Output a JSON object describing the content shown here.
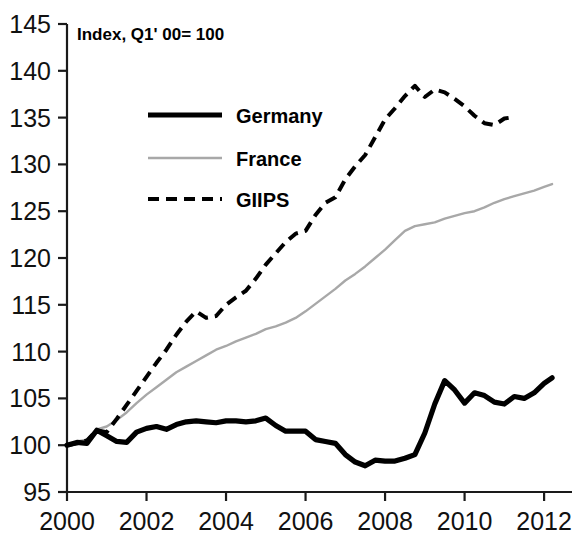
{
  "chart_data": {
    "type": "line",
    "title": "",
    "annotation": "Index, Q1' 00= 100",
    "xlabel": "",
    "ylabel": "",
    "xlim": [
      2000,
      2012.4
    ],
    "ylim": [
      95,
      145
    ],
    "grid": false,
    "legend_position": "upper-left-inside",
    "x_ticks": [
      "2000",
      "2002",
      "2004",
      "2006",
      "2008",
      "2010",
      "2012"
    ],
    "x_tick_values": [
      2000,
      2002,
      2004,
      2006,
      2008,
      2010,
      2012
    ],
    "y_ticks": [
      "95",
      "100",
      "105",
      "110",
      "115",
      "120",
      "125",
      "130",
      "135",
      "140",
      "145"
    ],
    "y_tick_values": [
      95,
      100,
      105,
      110,
      115,
      120,
      125,
      130,
      135,
      140,
      145
    ],
    "series": [
      {
        "name": "Germany",
        "color": "#000000",
        "style": "solid-thick",
        "x": [
          2000.0,
          2000.25,
          2000.5,
          2000.75,
          2001.0,
          2001.25,
          2001.5,
          2001.75,
          2002.0,
          2002.25,
          2002.5,
          2002.75,
          2003.0,
          2003.25,
          2003.5,
          2003.75,
          2004.0,
          2004.25,
          2004.5,
          2004.75,
          2005.0,
          2005.25,
          2005.5,
          2005.75,
          2006.0,
          2006.25,
          2006.5,
          2006.75,
          2007.0,
          2007.25,
          2007.5,
          2007.75,
          2008.0,
          2008.25,
          2008.5,
          2008.75,
          2009.0,
          2009.25,
          2009.5,
          2009.75,
          2010.0,
          2010.25,
          2010.5,
          2010.75,
          2011.0,
          2011.25,
          2011.5,
          2011.75,
          2012.0,
          2012.2
        ],
        "y": [
          100.0,
          100.3,
          100.2,
          101.6,
          101.0,
          100.4,
          100.3,
          101.4,
          101.8,
          102.0,
          101.7,
          102.2,
          102.5,
          102.6,
          102.5,
          102.4,
          102.6,
          102.6,
          102.5,
          102.6,
          102.9,
          102.1,
          101.5,
          101.5,
          101.5,
          100.6,
          100.4,
          100.2,
          99.0,
          98.2,
          97.8,
          98.4,
          98.3,
          98.3,
          98.6,
          99.0,
          101.3,
          104.4,
          106.9,
          105.9,
          104.5,
          105.6,
          105.3,
          104.6,
          104.4,
          105.2,
          105.0,
          105.6,
          106.6,
          107.2
        ]
      },
      {
        "name": "France",
        "color": "#a8a8a8",
        "style": "solid-thin",
        "x": [
          2000.0,
          2000.25,
          2000.5,
          2000.75,
          2001.0,
          2001.25,
          2001.5,
          2001.75,
          2002.0,
          2002.25,
          2002.5,
          2002.75,
          2003.0,
          2003.25,
          2003.5,
          2003.75,
          2004.0,
          2004.25,
          2004.5,
          2004.75,
          2005.0,
          2005.25,
          2005.5,
          2005.75,
          2006.0,
          2006.25,
          2006.5,
          2006.75,
          2007.0,
          2007.25,
          2007.5,
          2007.75,
          2008.0,
          2008.25,
          2008.5,
          2008.75,
          2009.0,
          2009.25,
          2009.5,
          2009.75,
          2010.0,
          2010.25,
          2010.5,
          2010.75,
          2011.0,
          2011.25,
          2011.5,
          2011.75,
          2012.0,
          2012.2
        ],
        "y": [
          100.0,
          100.4,
          100.6,
          101.7,
          102.0,
          102.7,
          103.5,
          104.5,
          105.4,
          106.2,
          107.0,
          107.8,
          108.4,
          109.0,
          109.6,
          110.2,
          110.6,
          111.1,
          111.5,
          111.9,
          112.4,
          112.7,
          113.1,
          113.6,
          114.3,
          115.1,
          115.9,
          116.7,
          117.6,
          118.3,
          119.1,
          120.0,
          120.9,
          121.9,
          122.9,
          123.4,
          123.6,
          123.8,
          124.2,
          124.5,
          124.8,
          125.0,
          125.4,
          125.9,
          126.3,
          126.6,
          126.9,
          127.2,
          127.6,
          127.9
        ]
      },
      {
        "name": "GIIPS",
        "color": "#000000",
        "style": "dashed",
        "x": [
          2000.0,
          2000.25,
          2000.5,
          2000.75,
          2001.0,
          2001.25,
          2001.5,
          2001.75,
          2002.0,
          2002.25,
          2002.5,
          2002.75,
          2003.0,
          2003.25,
          2003.5,
          2003.75,
          2004.0,
          2004.25,
          2004.5,
          2004.75,
          2005.0,
          2005.25,
          2005.5,
          2005.75,
          2006.0,
          2006.25,
          2006.5,
          2006.75,
          2007.0,
          2007.25,
          2007.5,
          2007.75,
          2008.0,
          2008.25,
          2008.5,
          2008.75,
          2009.0,
          2009.25,
          2009.5,
          2009.75,
          2010.0,
          2010.25,
          2010.5,
          2010.75,
          2011.0,
          2011.15
        ],
        "y": [
          100.0,
          100.2,
          100.5,
          101.6,
          101.4,
          102.8,
          104.3,
          105.8,
          107.3,
          108.8,
          110.2,
          111.8,
          113.2,
          114.3,
          113.6,
          113.8,
          115.0,
          115.8,
          116.5,
          117.8,
          119.3,
          120.5,
          121.7,
          122.6,
          122.9,
          124.6,
          125.9,
          126.5,
          128.4,
          129.8,
          131.0,
          132.9,
          134.8,
          136.0,
          137.3,
          138.4,
          137.2,
          138.0,
          137.7,
          137.0,
          136.2,
          135.2,
          134.4,
          134.2,
          134.9,
          135.0
        ]
      }
    ]
  },
  "legend": {
    "items": [
      {
        "label": "Germany"
      },
      {
        "label": "France"
      },
      {
        "label": "GIIPS"
      }
    ]
  }
}
